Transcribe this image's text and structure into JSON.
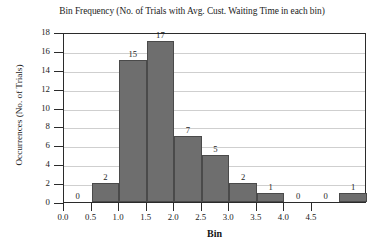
{
  "chart_data": {
    "type": "bar",
    "title": "Bin Frequency (No. of Trials with Avg. Cust. Waiting Time in each bin)",
    "xlabel": "Bin",
    "ylabel": "Occurrences (No. of Trials)",
    "categories": [
      "0.0",
      "0.5",
      "1.0",
      "1.5",
      "2.0",
      "2.5",
      "3.0",
      "3.5",
      "4.0",
      "4.5",
      ""
    ],
    "values": [
      0,
      2,
      15,
      17,
      7,
      5,
      2,
      1,
      0,
      0,
      1
    ],
    "bar_labels": [
      "0",
      "2",
      "15",
      "17",
      "7",
      "5",
      "2",
      "1",
      "0",
      "0",
      "1"
    ],
    "xtick_labels": [
      "0.0",
      "0.5",
      "1.0",
      "1.5",
      "2.0",
      "2.5",
      "3.0",
      "3.5",
      "4.0",
      "4.5"
    ],
    "ytick_labels": [
      "0",
      "2",
      "4",
      "6",
      "8",
      "10",
      "12",
      "14",
      "16",
      "18"
    ],
    "ytick_values": [
      0,
      2,
      4,
      6,
      8,
      10,
      12,
      14,
      16,
      18
    ],
    "ylim": [
      0,
      18
    ],
    "xlim": [
      0.0,
      5.5
    ],
    "grid": true,
    "legend": false,
    "bar_color": "#6e6e6e",
    "bar_edge_color": "#4a4a4a",
    "grid_color": "#cfcfcf",
    "axis_color": "#2b2b2b",
    "background_color": "#ffffff"
  }
}
